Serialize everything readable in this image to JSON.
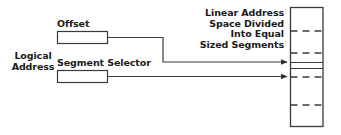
{
  "diagram": {
    "type": "block-diagram",
    "background_color": "#ffffff",
    "line_color": "#3a3a3a",
    "text_color": "#1a1a1a",
    "labels": {
      "logical_address": "Logical\nAddress",
      "offset": "Offset",
      "segment_selector": "Segment Selector",
      "linear_address_space": "Linear Address\nSpace Divided\nInto Equal\nSized Segments"
    },
    "boxes": [
      {
        "name": "offset-box",
        "label": "Offset",
        "x": 57,
        "y": 31,
        "width": 51,
        "height": 13
      },
      {
        "name": "segment-selector-box",
        "label": "Segment Selector",
        "x": 57,
        "y": 70,
        "width": 51,
        "height": 13
      },
      {
        "name": "linear-address-space-box",
        "label": "Linear Address Space Divided Into Equal Sized Segments",
        "x": 290,
        "y": 7,
        "width": 33,
        "height": 120
      }
    ],
    "segment_dividers": {
      "dashed_rows_y": [
        31,
        53,
        77,
        105
      ],
      "solid_rows_y": [
        62,
        68
      ]
    },
    "connectors": [
      {
        "name": "offset-connector",
        "from": "offset-box",
        "to": "linear-address-space-box",
        "arrow_y": 62
      },
      {
        "name": "segment-selector-connector",
        "from": "segment-selector-box",
        "to": "linear-address-space-box",
        "arrow_y": 77
      }
    ]
  }
}
